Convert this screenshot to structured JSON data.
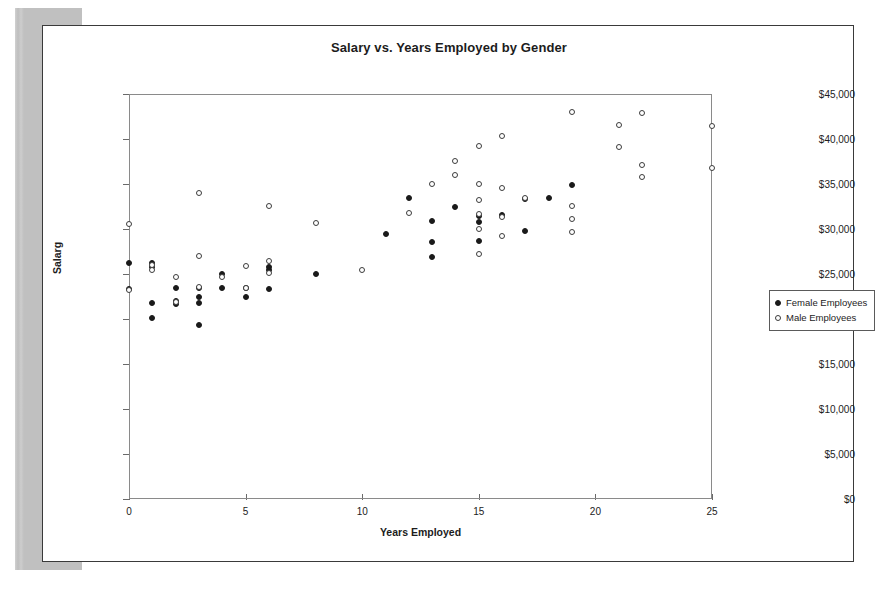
{
  "document": {
    "scan_sidebar_name": "scanned-page-shadow"
  },
  "chart_data": {
    "type": "scatter",
    "title": "Salary vs. Years Employed by Gender",
    "xlabel": "Years Employed",
    "ylabel": "Salarg",
    "xlim": [
      0,
      25
    ],
    "ylim": [
      0,
      45000
    ],
    "xticks": [
      "0",
      "5",
      "10",
      "15",
      "20",
      "25"
    ],
    "xtick_values": [
      0,
      5,
      10,
      15,
      20,
      25
    ],
    "yticks": [
      "$0",
      "$5,000",
      "$10,000",
      "$15,000",
      "$20,000",
      "$25,000",
      "$30,000",
      "$35,000",
      "$40,000",
      "$45,000"
    ],
    "ytick_values": [
      0,
      5000,
      10000,
      15000,
      20000,
      25000,
      30000,
      35000,
      40000,
      45000
    ],
    "grid": false,
    "legend_position": "right",
    "series": [
      {
        "name": "Female Employees",
        "marker": "filled-circle",
        "color": "#1a1a1a",
        "points": [
          [
            0,
            26200
          ],
          [
            0,
            23300
          ],
          [
            1,
            26200
          ],
          [
            1,
            25800
          ],
          [
            1,
            21800
          ],
          [
            1,
            20100
          ],
          [
            2,
            23400
          ],
          [
            2,
            22000
          ],
          [
            2,
            21700
          ],
          [
            3,
            23400
          ],
          [
            3,
            22400
          ],
          [
            3,
            21800
          ],
          [
            3,
            19300
          ],
          [
            4,
            25000
          ],
          [
            4,
            23400
          ],
          [
            5,
            23400
          ],
          [
            5,
            22400
          ],
          [
            6,
            25800
          ],
          [
            6,
            25500
          ],
          [
            6,
            23300
          ],
          [
            8,
            25000
          ],
          [
            11,
            29500
          ],
          [
            12,
            33500
          ],
          [
            13,
            30900
          ],
          [
            13,
            28600
          ],
          [
            13,
            26900
          ],
          [
            14,
            32500
          ],
          [
            15,
            31400
          ],
          [
            15,
            30800
          ],
          [
            15,
            28700
          ],
          [
            16,
            31600
          ],
          [
            17,
            33300
          ],
          [
            17,
            29800
          ],
          [
            18,
            33400
          ],
          [
            19,
            34900
          ]
        ]
      },
      {
        "name": "Male Employees",
        "marker": "open-circle",
        "color": "#3c3c3c",
        "points": [
          [
            0,
            30600
          ],
          [
            0,
            23200
          ],
          [
            1,
            26000
          ],
          [
            1,
            25400
          ],
          [
            2,
            24700
          ],
          [
            2,
            21900
          ],
          [
            3,
            34000
          ],
          [
            3,
            27000
          ],
          [
            3,
            23600
          ],
          [
            4,
            24700
          ],
          [
            5,
            25900
          ],
          [
            5,
            23500
          ],
          [
            6,
            32600
          ],
          [
            6,
            26400
          ],
          [
            6,
            25100
          ],
          [
            8,
            30700
          ],
          [
            10,
            25400
          ],
          [
            12,
            31800
          ],
          [
            13,
            35000
          ],
          [
            14,
            36000
          ],
          [
            14,
            37600
          ],
          [
            15,
            39200
          ],
          [
            15,
            35000
          ],
          [
            15,
            33200
          ],
          [
            15,
            31700
          ],
          [
            15,
            30000
          ],
          [
            15,
            27200
          ],
          [
            16,
            40300
          ],
          [
            16,
            34600
          ],
          [
            16,
            31300
          ],
          [
            16,
            29200
          ],
          [
            17,
            33400
          ],
          [
            19,
            43000
          ],
          [
            19,
            32600
          ],
          [
            19,
            31100
          ],
          [
            19,
            29700
          ],
          [
            21,
            41600
          ],
          [
            21,
            39100
          ],
          [
            22,
            42900
          ],
          [
            22,
            37100
          ],
          [
            22,
            35800
          ],
          [
            25,
            41400
          ],
          [
            25,
            36800
          ]
        ]
      }
    ]
  }
}
